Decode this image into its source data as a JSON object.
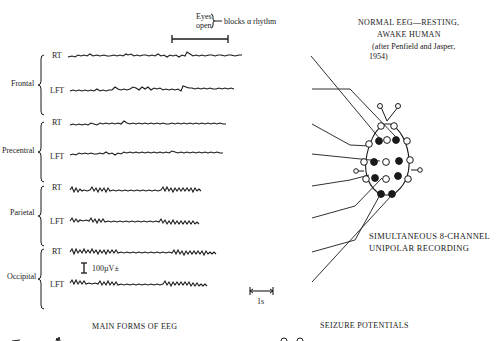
{
  "figure": {
    "title_line1": "NORMAL EEG—RESTING,",
    "title_line2": "AWAKE HUMAN",
    "citation_line1": "(after Penfield and Jasper,",
    "citation_line2": "1954)",
    "recording_line1": "SIMULTANEOUS 8-CHANNEL",
    "recording_line2": "UNIPOLAR RECORDING"
  },
  "annotations": {
    "eyes_line1": "Eyes",
    "eyes_line2": "open",
    "blocks": "blocks α rhythm",
    "amplitude_scale": "100µV±",
    "time_scale": "1s"
  },
  "regions": [
    {
      "name": "Frontal",
      "channels": [
        "RT",
        "LFT"
      ]
    },
    {
      "name": "Precentral",
      "channels": [
        "RT",
        "LFT"
      ]
    },
    {
      "name": "Parietal",
      "channels": [
        "RT",
        "LFT"
      ]
    },
    {
      "name": "Occipital",
      "channels": [
        "RT",
        "LFT"
      ]
    }
  ],
  "footer": {
    "left_caption": "MAIN FORMS OF EEG",
    "right_caption": "SEIZURE POTENTIALS"
  }
}
